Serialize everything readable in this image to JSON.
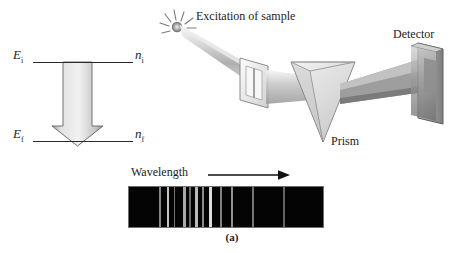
{
  "figure": {
    "caption": "(a)",
    "background": "#ffffff",
    "ink_color": "#1c1c1c"
  },
  "energy_diagram": {
    "name": "energy-level-transition-diagram",
    "upper_level": {
      "energy_symbol": "E",
      "energy_subscript": "i",
      "quantum_symbol": "n",
      "quantum_subscript": "i"
    },
    "lower_level": {
      "energy_symbol": "E",
      "energy_subscript": "f",
      "quantum_symbol": "n",
      "quantum_subscript": "f"
    },
    "transition_arrow": {
      "direction": "down",
      "meaning": "emission-transition"
    }
  },
  "apparatus": {
    "excitation_label": "Excitation of sample",
    "detector_label": "Detector",
    "prism_label": "Prism",
    "spark_icon": "starburst-icon",
    "beam_color": "#b8b8b8",
    "glass_color": "#cfcfcf",
    "metal_color": "#8a8a8a"
  },
  "spectrum": {
    "axis_label": "Wavelength",
    "axis_arrow": "arrow-right-icon",
    "background": "#040404",
    "line_color": "#e8e8e8",
    "chart_data": {
      "type": "line-spectrum",
      "title": "Emission line spectrum",
      "xlabel": "Wavelength",
      "xlim": [
        0,
        196
      ],
      "grid": false,
      "lines": [
        {
          "position": 30,
          "width": 2.0,
          "intensity": 0.58
        },
        {
          "position": 38,
          "width": 2.6,
          "intensity": 0.85
        },
        {
          "position": 45,
          "width": 1.6,
          "intensity": 0.5
        },
        {
          "position": 55,
          "width": 2.2,
          "intensity": 0.72
        },
        {
          "position": 61,
          "width": 1.4,
          "intensity": 0.45
        },
        {
          "position": 67,
          "width": 2.4,
          "intensity": 0.8
        },
        {
          "position": 74,
          "width": 1.8,
          "intensity": 0.6
        },
        {
          "position": 81,
          "width": 3.0,
          "intensity": 0.95
        },
        {
          "position": 92,
          "width": 1.6,
          "intensity": 0.55
        },
        {
          "position": 103,
          "width": 2.0,
          "intensity": 0.62
        },
        {
          "position": 124,
          "width": 2.2,
          "intensity": 0.5
        },
        {
          "position": 156,
          "width": 2.0,
          "intensity": 0.42
        }
      ]
    }
  }
}
